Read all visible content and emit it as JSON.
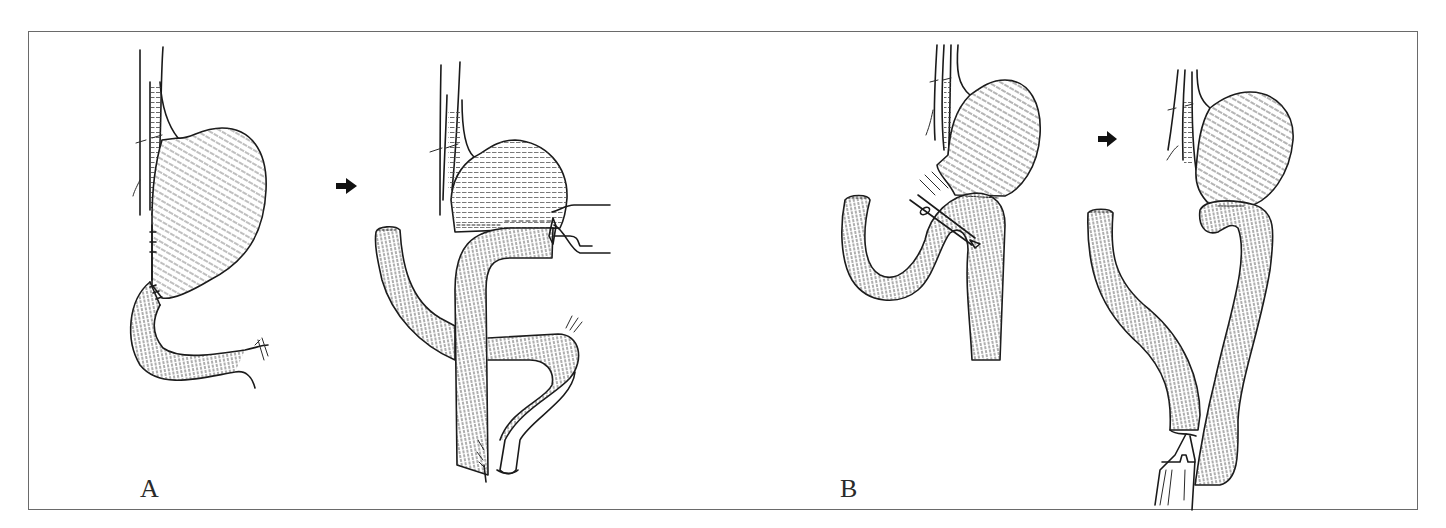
{
  "figure": {
    "background": "#ffffff",
    "frame_color": "#6a6a6a",
    "ink_color": "#1a1a1a"
  },
  "panels": [
    {
      "label": "A",
      "steps": [
        {
          "id": "A1",
          "description": "stomach-with-esophagus-and-duodenal-loop"
        },
        {
          "id": "A2",
          "description": "stomach-transected-with-jejunal-limbs-and-stapler"
        }
      ],
      "arrow": "right-arrow"
    },
    {
      "label": "B",
      "steps": [
        {
          "id": "B1",
          "description": "stomach-with-jejunal-loop-and-instrument"
        },
        {
          "id": "B2",
          "description": "gastrojejunal-anastomosis-with-stapler-below"
        }
      ],
      "arrow": "right-arrow"
    }
  ]
}
